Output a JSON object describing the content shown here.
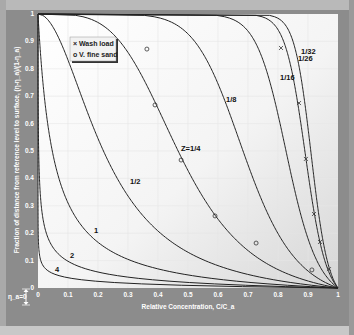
{
  "chart_data": {
    "type": "line",
    "title": "",
    "xlabel": "Relative Concentration, C/C_a",
    "ylabel": "Fraction of distance from reference level to surface, (η-η_a)/(1-η_a)",
    "xlim": [
      0,
      1
    ],
    "ylim": [
      0,
      1
    ],
    "x_ticks": [
      "0",
      "0.1",
      "0.2",
      "0.3",
      "0.4",
      "0.5",
      "0.6",
      "0.7",
      "0.8",
      "0.9",
      "1"
    ],
    "y_ticks": [
      "0",
      "0.1",
      "0.2",
      "0.3",
      "0.4",
      "0.5",
      "0.6",
      "0.7",
      "0.8",
      "0.9",
      "1"
    ],
    "grid": true,
    "reference_level_annotation": "η_a=0",
    "legend_position": "upper-left",
    "legend": [
      {
        "marker": "×",
        "label": "Wash load"
      },
      {
        "marker": "o",
        "label": "V. fine sand"
      }
    ],
    "reference_level_a": 0.05,
    "series": [
      {
        "name": "4",
        "z": 4,
        "label": "4",
        "label_pos": [
          0.05,
          0.06
        ]
      },
      {
        "name": "2",
        "z": 2,
        "label": "2",
        "label_pos": [
          0.1,
          0.11
        ]
      },
      {
        "name": "1",
        "z": 1,
        "label": "1",
        "label_pos": [
          0.18,
          0.2
        ]
      },
      {
        "name": "1/2",
        "z": 0.5,
        "label": "1/2",
        "label_pos": [
          0.3,
          0.38
        ]
      },
      {
        "name": "1/4",
        "z": 0.25,
        "label": "Z=1/4",
        "label_pos": [
          0.47,
          0.5
        ]
      },
      {
        "name": "1/8",
        "z": 0.125,
        "label": "1/8",
        "label_pos": [
          0.62,
          0.68
        ]
      },
      {
        "name": "1/16",
        "z": 0.0625,
        "label": "1/16",
        "label_pos": [
          0.8,
          0.76
        ]
      },
      {
        "name": "1/26",
        "z": 0.03846,
        "label": "1/26",
        "label_pos": [
          0.86,
          0.83
        ]
      },
      {
        "name": "1/32",
        "z": 0.03125,
        "label": "1/32",
        "label_pos": [
          0.87,
          0.855
        ]
      }
    ],
    "observations": [
      {
        "name": "Wash load",
        "marker": "x",
        "points": [
          [
            0.81,
            0.876
          ],
          [
            0.87,
            0.675
          ],
          [
            0.893,
            0.471
          ],
          [
            0.92,
            0.27
          ],
          [
            0.94,
            0.168
          ],
          [
            0.97,
            0.069
          ]
        ]
      },
      {
        "name": "V. fine sand",
        "marker": "o",
        "points": [
          [
            0.363,
            0.872
          ],
          [
            0.39,
            0.668
          ],
          [
            0.477,
            0.467
          ],
          [
            0.59,
            0.263
          ],
          [
            0.727,
            0.164
          ],
          [
            0.913,
            0.066
          ]
        ]
      }
    ]
  },
  "colors": {
    "plot_bg_top": "#ffffff",
    "plot_bg_bottom": "#dcdcdc",
    "frame": "#8c8c8c",
    "curve": "#222222",
    "text": "#ffffff"
  }
}
